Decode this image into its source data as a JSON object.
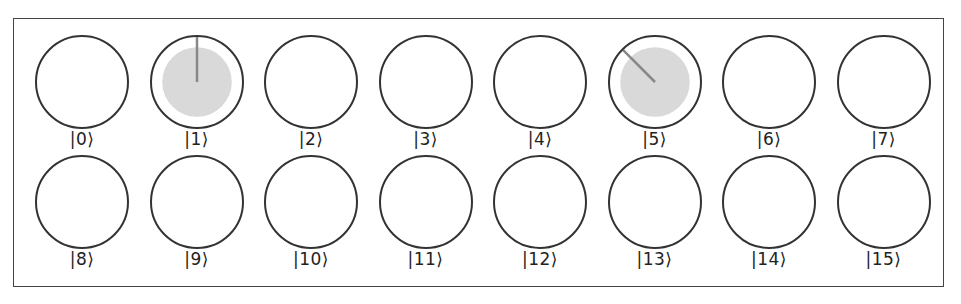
{
  "diagram": {
    "type": "circle-notation quantum register",
    "border_color": "#444444",
    "circle_stroke": "#333333",
    "fill_color": "#d9d9d9",
    "phase_line_color": "#888888",
    "states": [
      {
        "label": "|0⟩",
        "magnitude": 0,
        "phase_deg": 0
      },
      {
        "label": "|1⟩",
        "magnitude": 0.707,
        "phase_deg": 0
      },
      {
        "label": "|2⟩",
        "magnitude": 0,
        "phase_deg": 0
      },
      {
        "label": "|3⟩",
        "magnitude": 0,
        "phase_deg": 0
      },
      {
        "label": "|4⟩",
        "magnitude": 0,
        "phase_deg": 0
      },
      {
        "label": "|5⟩",
        "magnitude": 0.707,
        "phase_deg": 45
      },
      {
        "label": "|6⟩",
        "magnitude": 0,
        "phase_deg": 0
      },
      {
        "label": "|7⟩",
        "magnitude": 0,
        "phase_deg": 0
      },
      {
        "label": "|8⟩",
        "magnitude": 0,
        "phase_deg": 0
      },
      {
        "label": "|9⟩",
        "magnitude": 0,
        "phase_deg": 0
      },
      {
        "label": "|10⟩",
        "magnitude": 0,
        "phase_deg": 0
      },
      {
        "label": "|11⟩",
        "magnitude": 0,
        "phase_deg": 0
      },
      {
        "label": "|12⟩",
        "magnitude": 0,
        "phase_deg": 0
      },
      {
        "label": "|13⟩",
        "magnitude": 0,
        "phase_deg": 0
      },
      {
        "label": "|14⟩",
        "magnitude": 0,
        "phase_deg": 0
      },
      {
        "label": "|15⟩",
        "magnitude": 0,
        "phase_deg": 0
      }
    ]
  }
}
